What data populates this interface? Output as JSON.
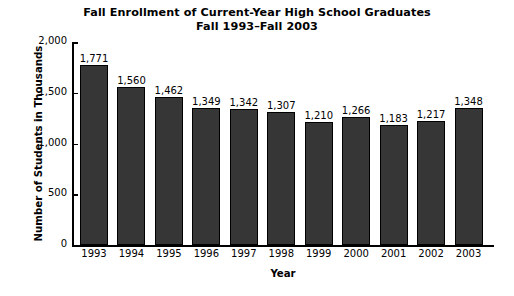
{
  "chart_data": {
    "type": "bar",
    "title": "Fall Enrollment of Current-Year High School Graduates",
    "subtitle": "Fall 1993–Fall 2003",
    "xlabel": "Year",
    "ylabel": "Number of Students in Thousands",
    "categories": [
      "1993",
      "1994",
      "1995",
      "1996",
      "1997",
      "1998",
      "1999",
      "2000",
      "2001",
      "2002",
      "2003"
    ],
    "values": [
      1771,
      1560,
      1462,
      1349,
      1342,
      1307,
      1210,
      1266,
      1183,
      1217,
      1348
    ],
    "value_labels": [
      "1,771",
      "1,560",
      "1,462",
      "1,349",
      "1,342",
      "1,307",
      "1,210",
      "1,266",
      "1,183",
      "1,217",
      "1,348"
    ],
    "ylim": [
      0,
      2000
    ],
    "yticks": [
      0,
      500,
      1000,
      1500,
      2000
    ],
    "ytick_labels": [
      "0",
      "500",
      "1,000",
      "1,500",
      "2,000"
    ],
    "grid": false,
    "legend": "none",
    "bar_color": "#363636",
    "bar_edge_color": "#000000",
    "background_color": "#ffffff",
    "text_color": "#000000"
  }
}
